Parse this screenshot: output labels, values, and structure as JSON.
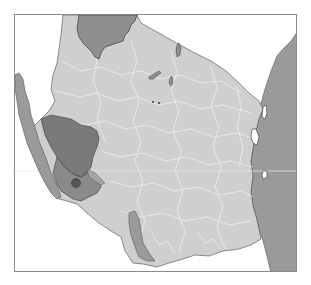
{
  "map": {
    "subject": "Tanzania locator map",
    "highlighted_region": "southwestern region",
    "colors": {
      "background": "#ffffff",
      "frame": "#8a8a8a",
      "country_fill": "#cfcfcf",
      "internal_borders": "#eeeeee",
      "neighbor_water": "#9a9a9a",
      "lake_fill": "#909090",
      "highlight_region": "#7a7a7a",
      "highlight_subregion": "#8c8c8c",
      "highlight_point": "#555555",
      "coast_line": "#444444"
    },
    "features": [
      {
        "name": "Lake Victoria",
        "type": "lake"
      },
      {
        "name": "Lake Tanganyika",
        "type": "lake"
      },
      {
        "name": "Lake Nyasa",
        "type": "lake"
      },
      {
        "name": "Indian Ocean",
        "type": "ocean"
      },
      {
        "name": "Zanzibar",
        "type": "island"
      },
      {
        "name": "Pemba",
        "type": "island"
      },
      {
        "name": "Mafia",
        "type": "island"
      }
    ]
  }
}
